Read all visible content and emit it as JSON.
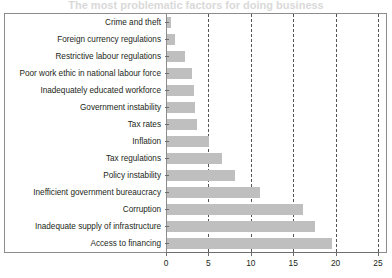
{
  "figure": {
    "title_remnant": "The most problematic factors for doing business",
    "bar_color": "#bfbfbf",
    "frame_color": "#8c8c8c",
    "grid_color": "#555555",
    "text_color": "#231f20"
  },
  "chart_data": {
    "type": "bar",
    "orientation": "horizontal",
    "title": "",
    "xlabel": "",
    "ylabel": "",
    "xlim": [
      0,
      25
    ],
    "ylim": null,
    "grid": "vertical dashed gridlines at 5, 10, 15, 20",
    "legend": null,
    "xticks": [
      0,
      5,
      10,
      15,
      20,
      25
    ],
    "xticklabels": [
      "0",
      "5",
      "10",
      "15",
      "20",
      "25"
    ],
    "categories": [
      "Crime and theft",
      "Foreign currency regulations",
      "Restrictive labour regulations",
      "Poor work ethic in national labour force",
      "Inadequately educated workforce",
      "Government instability",
      "Tax rates",
      "Inflation",
      "Tax regulations",
      "Policy instability",
      "Inefficient government bureaucracy",
      "Corruption",
      "Inadequate supply of infrastructure",
      "Access to financing"
    ],
    "values": [
      0.5,
      1.0,
      2.1,
      3.0,
      3.2,
      3.3,
      3.5,
      5.0,
      6.5,
      8.0,
      11.0,
      16.0,
      17.4,
      19.5
    ]
  }
}
